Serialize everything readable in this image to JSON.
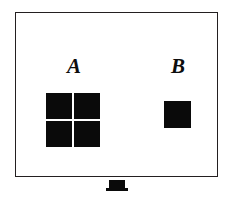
{
  "figure": {
    "background_color": "#ffffff",
    "ink_color": "#0d0d0d",
    "frame_color": "#231f20",
    "patch_color": "#0a0a0a"
  },
  "screen": {
    "name": "display-screen",
    "frame_label": ""
  },
  "stimuli": [
    {
      "id": "a",
      "label": "A",
      "type": "four-square-grid",
      "patch_count": 4,
      "patches": [
        "",
        "",
        "",
        ""
      ]
    },
    {
      "id": "b",
      "label": "B",
      "type": "single-square",
      "patch_count": 1,
      "patches": [
        ""
      ]
    }
  ],
  "stand": {
    "name": "screen-stand",
    "label": ""
  }
}
